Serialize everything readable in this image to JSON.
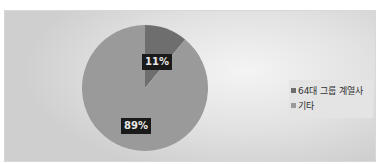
{
  "chart_data": {
    "type": "pie",
    "title": "",
    "categories": [
      "64대 그룹 계열사",
      "기타"
    ],
    "values": [
      11,
      89
    ],
    "labels": [
      "11%",
      "89%"
    ],
    "colors": [
      "#6e6e6e",
      "#9a9a9a"
    ],
    "legend_position": "right",
    "start_angle_deg": 0,
    "direction": "clockwise"
  },
  "legend": {
    "items": [
      {
        "label": "64대 그룹 계열사",
        "color": "#6e6e6e"
      },
      {
        "label": "기타",
        "color": "#9a9a9a"
      }
    ]
  },
  "data_labels": {
    "slice_1": "11%",
    "slice_2": "89%"
  }
}
